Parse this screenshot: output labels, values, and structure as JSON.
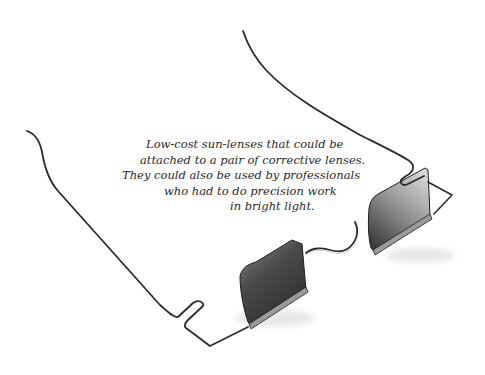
{
  "caption": {
    "lines": [
      "Low-cost sun-lenses that could be",
      "attached to a pair of corrective lenses.",
      "They could also be used by professionals",
      "who had to do precision work",
      "in bright light."
    ]
  },
  "image": {
    "subject": "wire-frame clip-on sun-lenses",
    "colors": {
      "background": "#ffffff",
      "wire": "#2b2b2b",
      "lens_dark": "#3a3a3a",
      "lens_light": "#bdbdbd"
    }
  }
}
